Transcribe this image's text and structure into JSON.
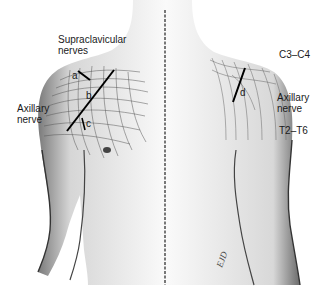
{
  "figure": {
    "views": [
      "anterior",
      "posterior"
    ],
    "labels": {
      "supraclavicular_line1": "Supraclavicular",
      "supraclavicular_line2": "nerves",
      "axillary_left_line1": "Axillary",
      "axillary_left_line2": "nerve",
      "c3_c4": "C3–C4",
      "axillary_right_line1": "Axillary",
      "axillary_right_line2": "nerve",
      "t2_t6": "T2–T6"
    },
    "markers": {
      "a": "a",
      "b": "b",
      "c": "c",
      "d": "d"
    },
    "signature": "EJD"
  }
}
